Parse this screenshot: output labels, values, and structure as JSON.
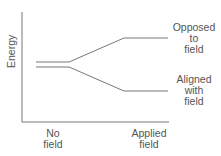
{
  "diagram": {
    "y_axis_label": "Energy",
    "x_labels": {
      "no_field": [
        "No",
        "field"
      ],
      "applied_field": [
        "Applied",
        "field"
      ]
    },
    "levels": {
      "opposed": [
        "Opposed",
        "to",
        "field"
      ],
      "aligned": [
        "Aligned",
        "with",
        "field"
      ]
    },
    "line_color": "#777777"
  }
}
